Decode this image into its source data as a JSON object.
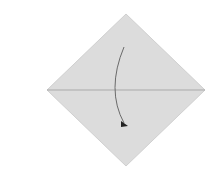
{
  "diagram": {
    "type": "origami-fold-step",
    "background_color": "#ffffff",
    "paper": {
      "shape": "diamond",
      "fill_color": "#dcdcdc",
      "edge_color": "#d0d0d0",
      "vertices": {
        "top": [
          126,
          14
        ],
        "right": [
          205,
          90
        ],
        "bottom": [
          126,
          166
        ],
        "left": [
          47,
          90
        ]
      }
    },
    "crease": {
      "kind": "horizontal-diagonal",
      "color": "#a9a9a9",
      "from": [
        47,
        90
      ],
      "to": [
        205,
        90
      ]
    },
    "fold_arrow": {
      "direction": "top-corner-down",
      "color": "#6a6a6a",
      "head_color": "#222222",
      "start": [
        124,
        47
      ],
      "control": [
        106,
        90
      ],
      "end": [
        126,
        125
      ]
    }
  }
}
